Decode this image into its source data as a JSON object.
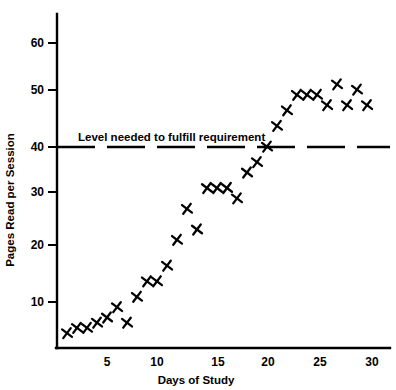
{
  "chart_data": {
    "type": "scatter",
    "title": "",
    "xlabel": "Days of Study",
    "ylabel": "Pages Read per Session",
    "xlim": [
      0,
      32
    ],
    "ylim": [
      0,
      65
    ],
    "xticks": [
      5,
      10,
      15,
      20,
      25,
      30
    ],
    "yticks": [
      10,
      20,
      30,
      40,
      50,
      60
    ],
    "xtick_labels": [
      "5",
      "10",
      "15",
      "20",
      "25",
      "30"
    ],
    "ytick_labels": [
      "10",
      "20",
      "30",
      "40",
      "50",
      "60"
    ],
    "grid": false,
    "legend": "none",
    "marker": "x",
    "marker_color": "#000000",
    "x": [
      1,
      2,
      3,
      4,
      5,
      6,
      7,
      8,
      9,
      10,
      11,
      12,
      13,
      14,
      15,
      16,
      17,
      18,
      19,
      20,
      21,
      22,
      23,
      24,
      25,
      26,
      27,
      28,
      29,
      30,
      31
    ],
    "values": [
      4,
      5,
      5,
      6,
      7,
      9,
      6,
      11,
      14,
      14,
      17,
      22,
      28,
      24,
      32,
      32,
      32,
      30,
      35,
      37,
      40,
      44,
      47,
      50,
      50,
      50,
      48,
      52,
      48,
      51,
      48
    ],
    "series": [
      {
        "name": "Pages read per session",
        "points": [
          {
            "x": 1,
            "y": 4
          },
          {
            "x": 2,
            "y": 5
          },
          {
            "x": 3,
            "y": 5
          },
          {
            "x": 4,
            "y": 6
          },
          {
            "x": 5,
            "y": 7
          },
          {
            "x": 6,
            "y": 9
          },
          {
            "x": 7,
            "y": 6
          },
          {
            "x": 8,
            "y": 11
          },
          {
            "x": 9,
            "y": 14
          },
          {
            "x": 10,
            "y": 14
          },
          {
            "x": 11,
            "y": 17
          },
          {
            "x": 12,
            "y": 22
          },
          {
            "x": 13,
            "y": 28
          },
          {
            "x": 14,
            "y": 24
          },
          {
            "x": 15,
            "y": 32
          },
          {
            "x": 16,
            "y": 32
          },
          {
            "x": 17,
            "y": 32
          },
          {
            "x": 18,
            "y": 30
          },
          {
            "x": 19,
            "y": 35
          },
          {
            "x": 20,
            "y": 37
          },
          {
            "x": 21,
            "y": 40
          },
          {
            "x": 22,
            "y": 44
          },
          {
            "x": 23,
            "y": 47
          },
          {
            "x": 24,
            "y": 50
          },
          {
            "x": 25,
            "y": 50
          },
          {
            "x": 26,
            "y": 50
          },
          {
            "x": 27,
            "y": 48
          },
          {
            "x": 28,
            "y": 52
          },
          {
            "x": 29,
            "y": 48
          },
          {
            "x": 30,
            "y": 51
          },
          {
            "x": 31,
            "y": 48
          }
        ]
      }
    ],
    "reference_line": {
      "value": 40,
      "label": "Level needed to fulfill requirement",
      "style": "dashed",
      "color": "#000000"
    },
    "annotations": [
      {
        "text": "Level needed to fulfill requirement",
        "x": 5,
        "y": 42
      }
    ]
  }
}
